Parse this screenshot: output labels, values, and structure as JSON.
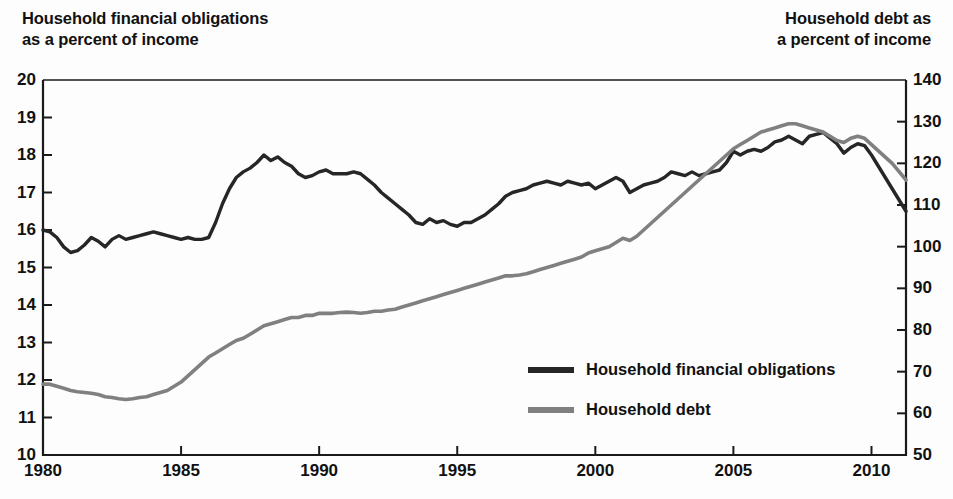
{
  "titles": {
    "left_line1": "Household financial obligations",
    "left_line2": "as a percent of income",
    "right_line1": "Household debt as",
    "right_line2": "a percent of income"
  },
  "colors": {
    "obligations": "#262626",
    "debt": "#808080",
    "axis": "#1a1a1a",
    "background": "#fdfdfd"
  },
  "legend": {
    "items": [
      {
        "label": "Household financial obligations",
        "color": "#262626"
      },
      {
        "label": "Household debt",
        "color": "#808080"
      }
    ]
  },
  "chart_data": {
    "type": "line",
    "xlabel": "",
    "ylabel": "Household financial obligations as a percent of income",
    "y2label": "Household debt as a percent of income",
    "xlim": [
      1980,
      2011.25
    ],
    "ylim": [
      10,
      20
    ],
    "y2lim": [
      50,
      140
    ],
    "grid": false,
    "legend_position": "center-right",
    "xticks": [
      1980,
      1985,
      1990,
      1995,
      2000,
      2005,
      2010
    ],
    "xtick_labels": [
      "1980",
      "1985",
      "1990",
      "1995",
      "2000",
      "2005",
      "2010"
    ],
    "yticks": [
      10,
      11,
      12,
      13,
      14,
      15,
      16,
      17,
      18,
      19,
      20
    ],
    "ytick_labels": [
      "10",
      "11",
      "12",
      "13",
      "14",
      "15",
      "16",
      "17",
      "18",
      "19",
      "20"
    ],
    "y2ticks": [
      50,
      60,
      70,
      80,
      90,
      100,
      110,
      120,
      130,
      140
    ],
    "y2tick_labels": [
      "50",
      "60",
      "70",
      "80",
      "90",
      "100",
      "110",
      "120",
      "130",
      "140"
    ],
    "series": [
      {
        "name": "Household financial obligations",
        "axis": "left",
        "color": "#262626",
        "units": "percent of income",
        "x": [
          1980.0,
          1980.25,
          1980.5,
          1980.75,
          1981.0,
          1981.25,
          1981.5,
          1981.75,
          1982.0,
          1982.25,
          1982.5,
          1982.75,
          1983.0,
          1983.25,
          1983.5,
          1983.75,
          1984.0,
          1984.25,
          1984.5,
          1984.75,
          1985.0,
          1985.25,
          1985.5,
          1985.75,
          1986.0,
          1986.25,
          1986.5,
          1986.75,
          1987.0,
          1987.25,
          1987.5,
          1987.75,
          1988.0,
          1988.25,
          1988.5,
          1988.75,
          1989.0,
          1989.25,
          1989.5,
          1989.75,
          1990.0,
          1990.25,
          1990.5,
          1990.75,
          1991.0,
          1991.25,
          1991.5,
          1991.75,
          1992.0,
          1992.25,
          1992.5,
          1992.75,
          1993.0,
          1993.25,
          1993.5,
          1993.75,
          1994.0,
          1994.25,
          1994.5,
          1994.75,
          1995.0,
          1995.25,
          1995.5,
          1995.75,
          1996.0,
          1996.25,
          1996.5,
          1996.75,
          1997.0,
          1997.25,
          1997.5,
          1997.75,
          1998.0,
          1998.25,
          1998.5,
          1998.75,
          1999.0,
          1999.25,
          1999.5,
          1999.75,
          2000.0,
          2000.25,
          2000.5,
          2000.75,
          2001.0,
          2001.25,
          2001.5,
          2001.75,
          2002.0,
          2002.25,
          2002.5,
          2002.75,
          2003.0,
          2003.25,
          2003.5,
          2003.75,
          2004.0,
          2004.25,
          2004.5,
          2004.75,
          2005.0,
          2005.25,
          2005.5,
          2005.75,
          2006.0,
          2006.25,
          2006.5,
          2006.75,
          2007.0,
          2007.25,
          2007.5,
          2007.75,
          2008.0,
          2008.25,
          2008.5,
          2008.75,
          2009.0,
          2009.25,
          2009.5,
          2009.75,
          2010.0,
          2010.25,
          2010.5,
          2010.75,
          2011.0,
          2011.25
        ],
        "y": [
          16.0,
          15.95,
          15.8,
          15.55,
          15.4,
          15.45,
          15.6,
          15.8,
          15.7,
          15.55,
          15.75,
          15.85,
          15.75,
          15.8,
          15.85,
          15.9,
          15.95,
          15.9,
          15.85,
          15.8,
          15.75,
          15.8,
          15.75,
          15.75,
          15.8,
          16.2,
          16.7,
          17.1,
          17.4,
          17.55,
          17.65,
          17.8,
          18.0,
          17.85,
          17.95,
          17.8,
          17.7,
          17.5,
          17.4,
          17.45,
          17.55,
          17.6,
          17.5,
          17.5,
          17.5,
          17.55,
          17.5,
          17.35,
          17.2,
          17.0,
          16.85,
          16.7,
          16.55,
          16.4,
          16.2,
          16.15,
          16.3,
          16.2,
          16.25,
          16.15,
          16.1,
          16.2,
          16.2,
          16.3,
          16.4,
          16.55,
          16.7,
          16.9,
          17.0,
          17.05,
          17.1,
          17.2,
          17.25,
          17.3,
          17.25,
          17.2,
          17.3,
          17.25,
          17.2,
          17.25,
          17.1,
          17.2,
          17.3,
          17.4,
          17.3,
          17.0,
          17.1,
          17.2,
          17.25,
          17.3,
          17.4,
          17.55,
          17.5,
          17.45,
          17.55,
          17.45,
          17.5,
          17.55,
          17.6,
          17.8,
          18.1,
          18.0,
          18.1,
          18.15,
          18.1,
          18.2,
          18.35,
          18.4,
          18.5,
          18.4,
          18.3,
          18.5,
          18.55,
          18.6,
          18.45,
          18.3,
          18.05,
          18.2,
          18.3,
          18.25,
          18.0,
          17.7,
          17.4,
          17.1,
          16.8,
          16.5
        ],
        "annotations": {
          "start_1980": 16.0,
          "peak_1987q4": 18.0,
          "trough_1993q4": 16.15,
          "peak_2007": 18.6,
          "end_2011": 16.5
        }
      },
      {
        "name": "Household debt",
        "axis": "right",
        "color": "#808080",
        "units": "percent of income",
        "x": [
          1980.0,
          1980.25,
          1980.5,
          1980.75,
          1981.0,
          1981.25,
          1981.5,
          1981.75,
          1982.0,
          1982.25,
          1982.5,
          1982.75,
          1983.0,
          1983.25,
          1983.5,
          1983.75,
          1984.0,
          1984.25,
          1984.5,
          1984.75,
          1985.0,
          1985.25,
          1985.5,
          1985.75,
          1986.0,
          1986.25,
          1986.5,
          1986.75,
          1987.0,
          1987.25,
          1987.5,
          1987.75,
          1988.0,
          1988.25,
          1988.5,
          1988.75,
          1989.0,
          1989.25,
          1989.5,
          1989.75,
          1990.0,
          1990.25,
          1990.5,
          1990.75,
          1991.0,
          1991.25,
          1991.5,
          1991.75,
          1992.0,
          1992.25,
          1992.5,
          1992.75,
          1993.0,
          1993.25,
          1993.5,
          1993.75,
          1994.0,
          1994.25,
          1994.5,
          1994.75,
          1995.0,
          1995.25,
          1995.5,
          1995.75,
          1996.0,
          1996.25,
          1996.5,
          1996.75,
          1997.0,
          1997.25,
          1997.5,
          1997.75,
          1998.0,
          1998.25,
          1998.5,
          1998.75,
          1999.0,
          1999.25,
          1999.5,
          1999.75,
          2000.0,
          2000.25,
          2000.5,
          2000.75,
          2001.0,
          2001.25,
          2001.5,
          2001.75,
          2002.0,
          2002.25,
          2002.5,
          2002.75,
          2003.0,
          2003.25,
          2003.5,
          2003.75,
          2004.0,
          2004.25,
          2004.5,
          2004.75,
          2005.0,
          2005.25,
          2005.5,
          2005.75,
          2006.0,
          2006.25,
          2006.5,
          2006.75,
          2007.0,
          2007.25,
          2007.5,
          2007.75,
          2008.0,
          2008.25,
          2008.5,
          2008.75,
          2009.0,
          2009.25,
          2009.5,
          2009.75,
          2010.0,
          2010.25,
          2010.5,
          2010.75,
          2011.0,
          2011.25
        ],
        "y": [
          67.0,
          67.0,
          66.5,
          66.0,
          65.5,
          65.2,
          65.0,
          64.8,
          64.5,
          64.0,
          63.8,
          63.5,
          63.3,
          63.5,
          63.8,
          64.0,
          64.5,
          65.0,
          65.5,
          66.5,
          67.5,
          69.0,
          70.5,
          72.0,
          73.5,
          74.5,
          75.5,
          76.5,
          77.5,
          78.0,
          79.0,
          80.0,
          81.0,
          81.5,
          82.0,
          82.5,
          83.0,
          83.0,
          83.5,
          83.5,
          84.0,
          84.0,
          84.0,
          84.2,
          84.3,
          84.2,
          84.0,
          84.2,
          84.5,
          84.5,
          84.8,
          85.0,
          85.5,
          86.0,
          86.5,
          87.0,
          87.5,
          88.0,
          88.5,
          89.0,
          89.5,
          90.0,
          90.5,
          91.0,
          91.5,
          92.0,
          92.5,
          93.0,
          93.0,
          93.2,
          93.5,
          94.0,
          94.5,
          95.0,
          95.5,
          96.0,
          96.5,
          97.0,
          97.5,
          98.5,
          99.0,
          99.5,
          100.0,
          101.0,
          102.0,
          101.5,
          102.5,
          104.0,
          105.5,
          107.0,
          108.5,
          110.0,
          111.5,
          113.0,
          114.5,
          116.0,
          117.5,
          119.0,
          120.5,
          122.0,
          123.5,
          124.5,
          125.5,
          126.5,
          127.5,
          128.0,
          128.5,
          129.0,
          129.5,
          129.5,
          129.0,
          128.5,
          128.0,
          127.5,
          126.5,
          125.5,
          125.0,
          126.0,
          126.5,
          126.0,
          124.5,
          123.0,
          121.5,
          120.0,
          118.0,
          116.0
        ],
        "annotations": {
          "start_1980": 67.0,
          "trough_1983": 63.3,
          "peak_2007": 129.5,
          "end_2011": 116.0
        }
      }
    ]
  }
}
